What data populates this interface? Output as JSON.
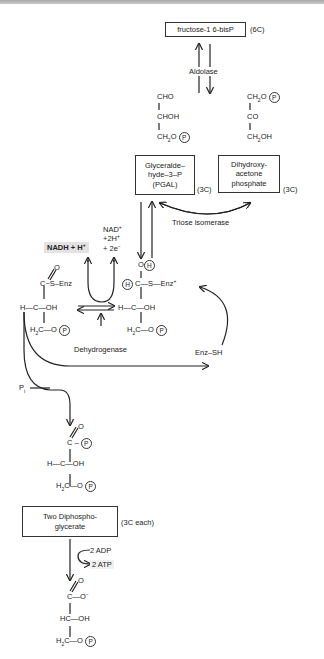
{
  "top_box": {
    "label": "fructose-1 6-bisP",
    "carbons": "(6C)"
  },
  "enzymes": {
    "aldolase": "Aldolase",
    "triose_isomerase": "Triose isomerase",
    "dehydrogenase": "Dehydrogenase"
  },
  "pgal_structure": {
    "line1": "CHO",
    "line2": "CHOH",
    "line3": "CH",
    "line3_sub": "2",
    "line3_o": "O",
    "p": "P"
  },
  "dhap_structure": {
    "line1": "CH",
    "line1_sub": "2",
    "line1_o": "O",
    "p": "P",
    "line2": "CO",
    "line3": "CH",
    "line3_sub": "2",
    "line3_oh": "OH"
  },
  "pgal_box": {
    "line1": "Glyceralde–",
    "line2": "hyde–3–P",
    "line3": "(PGAL)",
    "carbons": "(3C)"
  },
  "dhap_box": {
    "line1": "Dihydroxy-",
    "line2": "acetone",
    "line3": "phosphate",
    "carbons": "(3C)"
  },
  "cofactors": {
    "nadh": "NADH + H",
    "nadh_sup": "+",
    "nad": "NAD",
    "nad_sup": "+",
    "h2": "+2H",
    "h2_sup": "+",
    "e2": "+ 2e",
    "e2_sup": "−"
  },
  "thioester": {
    "o_top": "O",
    "c_s_enz": "C~S–Enz",
    "h_c_oh": "H—C—OH",
    "h2c": "H",
    "h2c_sub": "2",
    "h2c_rest": "C—O",
    "p": "P"
  },
  "hemithioacetal": {
    "o": "O",
    "h_circle": "H",
    "h_left": "H",
    "c_s_enz": "C—S—Enz",
    "enz_sup": "+",
    "h_c_oh": "H—C—OH",
    "h2c": "H",
    "h2c_sub": "2",
    "h2c_rest": "C—O",
    "p": "P"
  },
  "enz_sh": "Enz–SH",
  "pi": {
    "label": "P",
    "sub": "i"
  },
  "bpg_structure": {
    "o_top": "O",
    "c": "C",
    "p1": "P",
    "h_c_oh": "H—C—OH",
    "h2c": "H",
    "h2c_sub": "2",
    "h2c_rest": "C—O",
    "p2": "P"
  },
  "bpg_box": {
    "line1": "Two Diphospho-",
    "line2": "glycerate",
    "carbons": "(3C each)"
  },
  "atp_step": {
    "adp": "2 ADP",
    "atp": "2 ATP"
  },
  "pg_structure": {
    "o_top": "O",
    "c_o": "C—O",
    "o_sup": "−",
    "hc_oh": "HC—OH",
    "h2c": "H",
    "h2c_sub": "2",
    "h2c_rest": "C—O",
    "p": "P"
  }
}
